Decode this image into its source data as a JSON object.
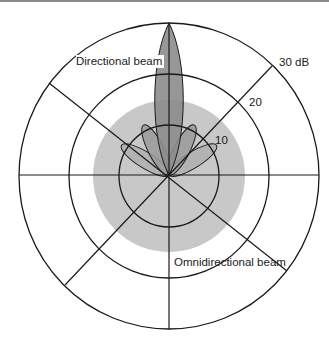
{
  "diagram": {
    "labels": {
      "directional": "Directional beam",
      "omnidirectional": "Omnidirectional beam"
    },
    "rings": [
      {
        "label": "10",
        "db": 10
      },
      {
        "label": "20",
        "db": 20
      },
      {
        "label": "30 dB",
        "db": 30
      }
    ],
    "colors": {
      "grid": "#1a1a1a",
      "omni_fill": "#c8c8c8",
      "main_lobe": "#8c8c8c",
      "side_lobe_inner": "#9a9a9a",
      "side_lobe_outer": "#a8a8a8",
      "background": "#ffffff"
    },
    "omnidirectional_beam_radius_db": 15,
    "directional_beam": {
      "main_lobe": {
        "direction_deg": 90,
        "gain_db": 30
      },
      "side_lobes": [
        {
          "direction_deg": 117,
          "gain_db": 11
        },
        {
          "direction_deg": 63,
          "gain_db": 11
        },
        {
          "direction_deg": 148,
          "gain_db": 10
        },
        {
          "direction_deg": 32,
          "gain_db": 10
        }
      ]
    }
  }
}
